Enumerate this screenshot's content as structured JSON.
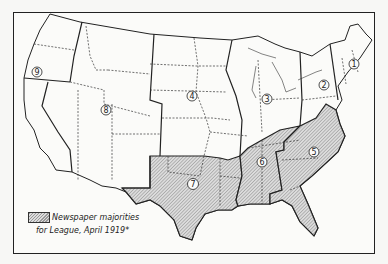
{
  "map": {
    "subject": "United States regional map",
    "regions": [
      {
        "id": "1",
        "label": "1",
        "x": 354,
        "y": 64
      },
      {
        "id": "2",
        "label": "2",
        "x": 324,
        "y": 85
      },
      {
        "id": "3",
        "label": "3",
        "x": 267,
        "y": 99
      },
      {
        "id": "4",
        "label": "4",
        "x": 192,
        "y": 96
      },
      {
        "id": "5",
        "label": "5",
        "x": 314,
        "y": 152
      },
      {
        "id": "6",
        "label": "6",
        "x": 262,
        "y": 162
      },
      {
        "id": "7",
        "label": "7",
        "x": 193,
        "y": 184
      },
      {
        "id": "8",
        "label": "8",
        "x": 106,
        "y": 110
      },
      {
        "id": "9",
        "label": "9",
        "x": 37,
        "y": 72
      }
    ],
    "shaded_regions": [
      "5",
      "6",
      "7"
    ]
  },
  "legend": {
    "line1": "Newspaper majorities",
    "line2": "for League, April 1919*"
  },
  "colors": {
    "line": "#222222",
    "hatch": "#999999",
    "background": "#fbfbf9"
  }
}
